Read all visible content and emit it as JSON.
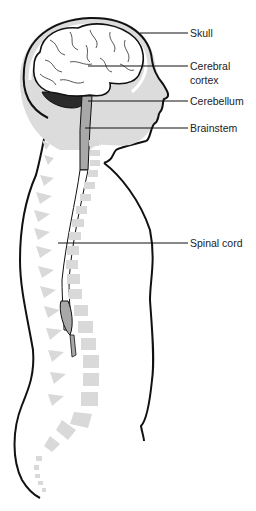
{
  "diagram": {
    "labels": [
      {
        "id": "skull",
        "text": "Skull",
        "y": 33
      },
      {
        "id": "cerebral-cortex",
        "text": "Cerebral\ncortex",
        "line1": "Cerebral",
        "line2": "cortex",
        "y": 66
      },
      {
        "id": "cerebellum",
        "text": "Cerebellum",
        "y": 101
      },
      {
        "id": "brainstem",
        "text": "Brainstem",
        "y": 128
      },
      {
        "id": "spinal-cord",
        "text": "Spinal cord",
        "y": 243
      }
    ],
    "colors": {
      "outline": "#111111",
      "skull_fill": "#dcdcdc",
      "brain_fill": "#ffffff",
      "cerebellum_fill": "#2a2a2a",
      "brainstem_fill": "#a8a8a8",
      "vertebrae_fill": "#d9d9d9",
      "label_text": "#222222"
    }
  }
}
